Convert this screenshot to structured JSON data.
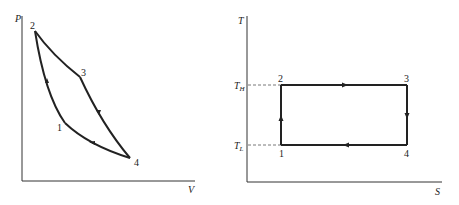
{
  "diagrams": [
    {
      "id": "pv",
      "type": "P-V diagram",
      "x_axis_label": "V",
      "y_axis_label": "P",
      "points": [
        {
          "label": "1",
          "x": 65,
          "y": 123
        },
        {
          "label": "2",
          "x": 35,
          "y": 31
        },
        {
          "label": "3",
          "x": 80,
          "y": 77
        },
        {
          "label": "4",
          "x": 130,
          "y": 158
        }
      ],
      "process_order": [
        "1",
        "2",
        "3",
        "4",
        "1"
      ]
    },
    {
      "id": "ts",
      "type": "T-S diagram",
      "x_axis_label": "S",
      "y_axis_label": "T",
      "level_labels": {
        "high": "T",
        "high_sub": "H",
        "low": "T",
        "low_sub": "L"
      },
      "points": [
        {
          "label": "1",
          "x": 281,
          "y": 145
        },
        {
          "label": "2",
          "x": 281,
          "y": 85
        },
        {
          "label": "3",
          "x": 407,
          "y": 85
        },
        {
          "label": "4",
          "x": 407,
          "y": 145
        }
      ],
      "process_order": [
        "1",
        "2",
        "3",
        "4",
        "1"
      ]
    }
  ],
  "colors": {
    "line": "#222222",
    "dashed": "#555555"
  }
}
